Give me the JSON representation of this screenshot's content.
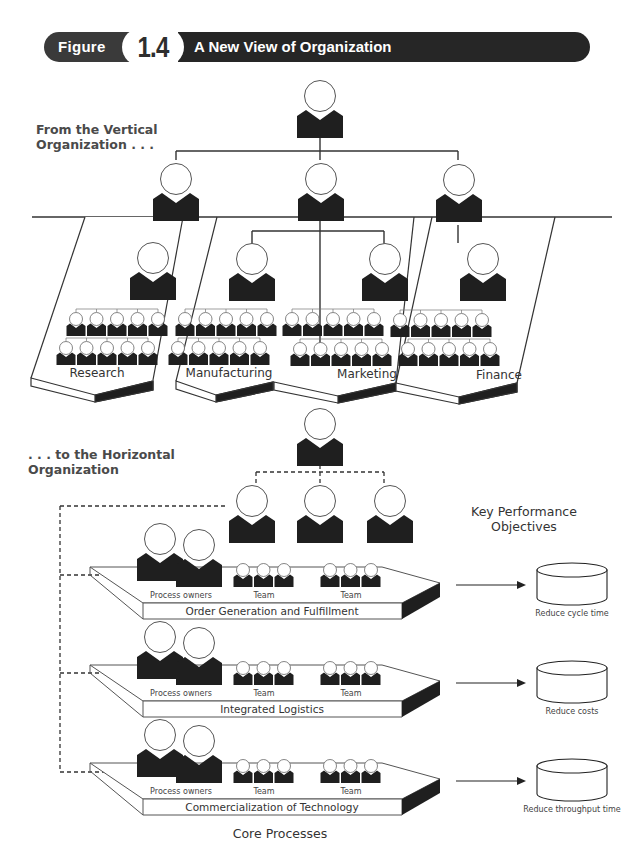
{
  "header": {
    "figure_label": "Figure",
    "figure_number": "1.4",
    "title": "A New View of Organization"
  },
  "vertical": {
    "title_line1": "From the Vertical",
    "title_line2": "Organization . . .",
    "departments": [
      {
        "label": "Research"
      },
      {
        "label": "Manufacturing"
      },
      {
        "label": "Marketing"
      },
      {
        "label": "Finance"
      }
    ]
  },
  "horizontal": {
    "title_line1": ". . . to the Horizontal",
    "title_line2": "Organization",
    "kpo_title_line1": "Key Performance",
    "kpo_title_line2": "Objectives",
    "core_processes_label": "Core Processes",
    "process_owners_label": "Process owners",
    "team_label": "Team",
    "processes": [
      {
        "name": "Order Generation and Fulfillment",
        "objective": "Reduce cycle time"
      },
      {
        "name": "Integrated Logistics",
        "objective": "Reduce costs"
      },
      {
        "name": "Commercialization of Technology",
        "objective": "Reduce throughput time"
      }
    ]
  },
  "colors": {
    "figure_dark": "#1f1f1f",
    "line": "#333333",
    "banner_left": "#3a3a3a",
    "banner_right": "#262626",
    "section_title": "#4a4a4a"
  }
}
